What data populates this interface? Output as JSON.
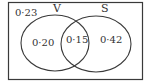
{
  "diagram": {
    "type": "venn",
    "universal_value": "0·23",
    "sets": [
      {
        "name": "V",
        "only_value": "0·20"
      },
      {
        "name": "S",
        "only_value": "0·42"
      }
    ],
    "intersection_value": "0·15",
    "colors": {
      "stroke": "#3a3a3a",
      "background": "#ffffff",
      "text": "#333333"
    }
  }
}
